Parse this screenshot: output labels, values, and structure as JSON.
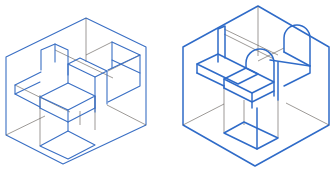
{
  "diagram": {
    "type": "isometric-technical-drawing",
    "colors": {
      "visible_edges": "#3a6fc4",
      "hidden_construction_edges": "#5a5550",
      "background": "#ffffff"
    },
    "figures": [
      {
        "id": "left",
        "description": "Isometric block assembly inside a bounding cube: cross-shaped stepped blocks with a lower rectangular column"
      },
      {
        "id": "right",
        "description": "Isometric part inside a bounding cube: flat base with two semicircular arched tabs and a rectangular column below"
      }
    ]
  }
}
